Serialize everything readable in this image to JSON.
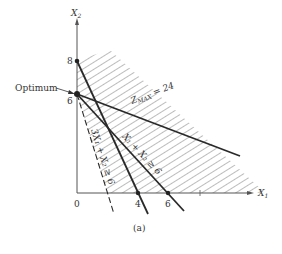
{
  "figure": {
    "caption": "(a)",
    "axes": {
      "x_label": "X",
      "x_label_sub": "1",
      "y_label": "X",
      "y_label_sub": "2",
      "origin_label": "0",
      "x_ticks": [
        "4",
        "6"
      ],
      "y_ticks": [
        "8",
        "6"
      ]
    },
    "annotations": {
      "optimum": "Optimum",
      "objective": "Z",
      "objective_sub": "MAX",
      "objective_rhs": " = 24",
      "constraint_1": "X₁ + X₂ ≥ 6",
      "constraint_2": "3X₁ + X₂ ≥ 6"
    },
    "colors": {
      "line": "#2a2a2a",
      "hatch": "#6a6a6a",
      "axis": "#555555"
    }
  }
}
